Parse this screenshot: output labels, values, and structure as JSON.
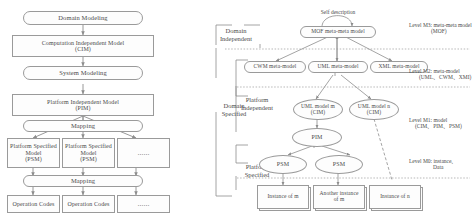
{
  "figure": {
    "left_diagram": {
      "name": "MDA development process flow",
      "nodes": [
        {
          "id": "domain-modeling",
          "label": "Domain Modeling",
          "shape": "stadium"
        },
        {
          "id": "cim",
          "label": "Computation Independent Model\n(CIM)",
          "shape": "rect"
        },
        {
          "id": "system-modeling",
          "label": "System Modeling",
          "shape": "stadium"
        },
        {
          "id": "pim",
          "label": "Platform Independent Model\n(PIM)",
          "shape": "rect"
        },
        {
          "id": "mapping-1",
          "label": "Mapping",
          "shape": "stadium"
        },
        {
          "id": "psm-1",
          "label": "Platform Specified\nModel\n(PSM)",
          "shape": "rect"
        },
        {
          "id": "psm-2",
          "label": "Platform Specified\nModel\n(PSM)",
          "shape": "rect"
        },
        {
          "id": "psm-more",
          "label": "……",
          "shape": "rect"
        },
        {
          "id": "mapping-2",
          "label": "Mapping",
          "shape": "stadium"
        },
        {
          "id": "codes-1",
          "label": "Operation Codes",
          "shape": "rect"
        },
        {
          "id": "codes-2",
          "label": "Operation Codes",
          "shape": "rect"
        },
        {
          "id": "codes-more",
          "label": "……",
          "shape": "rect"
        }
      ]
    },
    "right_diagram": {
      "name": "MOF four-layer metamodel architecture",
      "self_description_label": "Self description",
      "brackets": [
        {
          "id": "domain-independent",
          "label": "Domain\nIndependent"
        },
        {
          "id": "domain-specified",
          "label": "Domain\nSpecified"
        },
        {
          "id": "platform-independent",
          "label": "Platform\nIndependent"
        },
        {
          "id": "platform-specified",
          "label": "Platform\nSpecified"
        }
      ],
      "levels": [
        {
          "id": "m3",
          "line1": "Level M3:  meta-meta model",
          "line2": "(MOF)"
        },
        {
          "id": "m2",
          "line1": "Level M2:  meta-model",
          "line2": "(UML、CWM、XMI)"
        },
        {
          "id": "m1",
          "line1": "Level M1:  model",
          "line2": "(CIM、PIM、PSM)"
        },
        {
          "id": "m0",
          "line1": "Level M0:  instance、",
          "line2": "Data"
        }
      ],
      "nodes": [
        {
          "id": "mof",
          "label": "MOF meta-meta model",
          "shape": "stadium"
        },
        {
          "id": "cwm-meta",
          "label": "CWM meta-model",
          "shape": "stadium"
        },
        {
          "id": "uml-meta",
          "label": "UML meta-model",
          "shape": "stadium"
        },
        {
          "id": "xml-meta",
          "label": "XML meta-model",
          "shape": "stadium"
        },
        {
          "id": "uml-model-m",
          "label": "UML model m\n(CIM)",
          "shape": "ellipse"
        },
        {
          "id": "uml-model-n",
          "label": "UML model n\n(CIM)",
          "shape": "ellipse"
        },
        {
          "id": "pim",
          "label": "PIM",
          "shape": "ellipse"
        },
        {
          "id": "psm-left",
          "label": "PSM",
          "shape": "ellipse"
        },
        {
          "id": "psm-right",
          "label": "PSM",
          "shape": "ellipse"
        },
        {
          "id": "instance-m",
          "label": "Instance of m",
          "shape": "doc"
        },
        {
          "id": "another-inst",
          "label": "Another instance\nof m",
          "shape": "doc"
        },
        {
          "id": "instance-n",
          "label": "Instance of n",
          "shape": "doc"
        }
      ]
    }
  }
}
